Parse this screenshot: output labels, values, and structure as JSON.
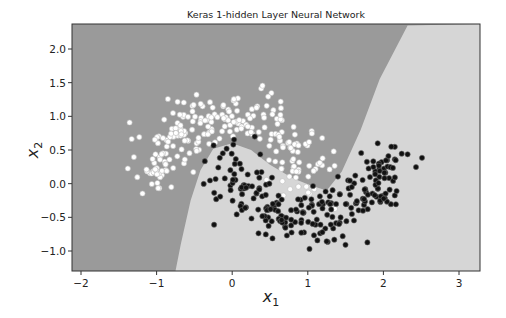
{
  "chart_data": {
    "type": "scatter",
    "title": "Keras 1-hidden Layer Neural Network",
    "xlabel": "x_1",
    "ylabel": "x_2",
    "xlim": [
      -2.1,
      3.3
    ],
    "ylim": [
      -1.3,
      2.35
    ],
    "xticks": [
      -2,
      -1,
      0,
      1,
      2,
      3
    ],
    "xtick_labels": [
      "−2",
      "−1",
      "0",
      "1",
      "2",
      "3"
    ],
    "yticks": [
      -1.0,
      -0.5,
      0.0,
      0.5,
      1.0,
      1.5,
      2.0
    ],
    "ytick_labels": [
      "−1.0",
      "−0.5",
      "0.0",
      "0.5",
      "1.0",
      "1.5",
      "2.0"
    ],
    "grid": false,
    "legend": null,
    "background_regions": {
      "class_0_color": "#9a9a9a",
      "class_1_color": "#d6d6d6",
      "boundary_approx": [
        [
          -0.75,
          -1.3
        ],
        [
          -0.68,
          -0.9
        ],
        [
          -0.55,
          -0.25
        ],
        [
          -0.42,
          0.2
        ],
        [
          -0.25,
          0.52
        ],
        [
          0.0,
          0.6
        ],
        [
          0.25,
          0.5
        ],
        [
          0.5,
          0.28
        ],
        [
          0.8,
          0.08
        ],
        [
          1.05,
          -0.03
        ],
        [
          1.25,
          -0.1
        ],
        [
          1.45,
          0.18
        ],
        [
          1.7,
          0.8
        ],
        [
          1.95,
          1.55
        ],
        [
          2.32,
          2.35
        ]
      ]
    },
    "series": [
      {
        "name": "class 0",
        "color": "#ffffff",
        "description": "upper moon, ~250 points",
        "x_range": [
          -1.6,
          1.6
        ],
        "y_range": [
          -0.5,
          1.35
        ]
      },
      {
        "name": "class 1",
        "color": "#111111",
        "description": "lower moon, ~250 points",
        "x_range": [
          -0.4,
          2.3
        ],
        "y_range": [
          -0.8,
          0.6
        ]
      }
    ]
  }
}
